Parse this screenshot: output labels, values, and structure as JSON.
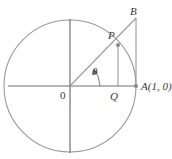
{
  "figure": {
    "background_color": "#ffffff",
    "stroke_color": "#8c8c8c",
    "axis_color": "#6b6b6b",
    "text_color": "#3a3a3a"
  },
  "labels": {
    "point_b": "B",
    "point_p": "P",
    "point_a": "A(1, 0)",
    "point_q": "Q",
    "origin": "0",
    "angle": "θ"
  },
  "geometry": {
    "center_x": 70,
    "center_y": 86,
    "radius": 66,
    "point_a_x": 136,
    "point_a_y": 86,
    "point_p_x": 118,
    "point_p_y": 45,
    "point_q_x": 118,
    "point_q_y": 86,
    "point_b_x": 136,
    "point_b_y": 18,
    "angle_degrees": 32
  },
  "icons": {
    "angle_arc": "angle-arc-arrow-icon",
    "point_marker": "point-dot-icon"
  }
}
